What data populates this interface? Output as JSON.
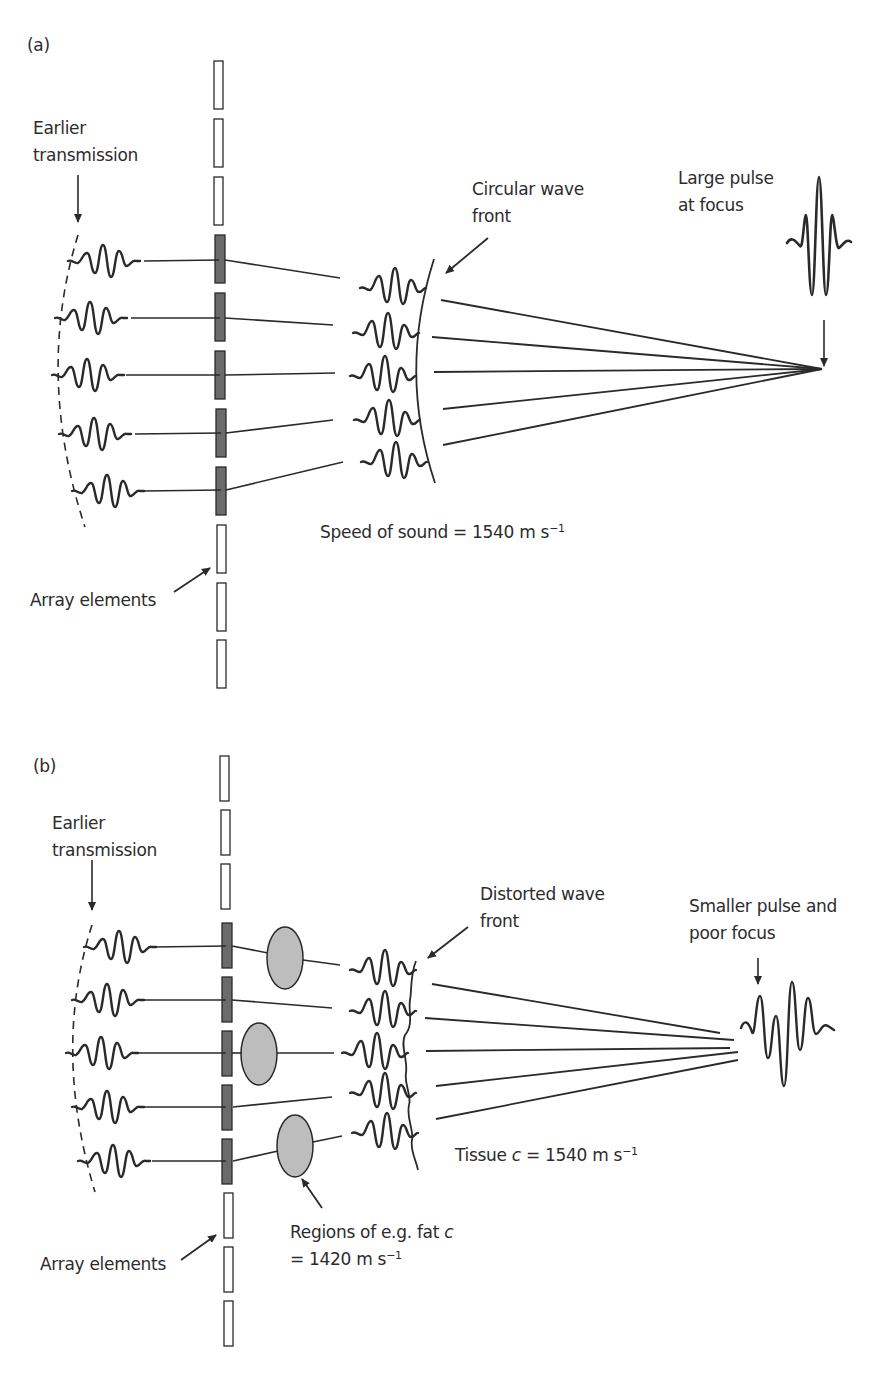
{
  "figure": {
    "panel_a": {
      "tag": "(a)",
      "earlier_transmission": [
        "Earlier",
        "transmission"
      ],
      "wavefront_label": [
        "Circular wave",
        "front"
      ],
      "focus_label": [
        "Large pulse",
        "at focus"
      ],
      "speed_label": "Speed of sound = 1540 m s",
      "speed_exp": "−1",
      "array_label": "Array elements"
    },
    "panel_b": {
      "tag": "(b)",
      "earlier_transmission": [
        "Earlier",
        "transmission"
      ],
      "wavefront_label": [
        "Distorted wave",
        "front"
      ],
      "focus_label": [
        "Smaller pulse and",
        "poor focus"
      ],
      "tissue_label_prefix": "Tissue ",
      "tissue_label_var": "c",
      "tissue_label_value": " = 1540 m s",
      "tissue_exp": "−1",
      "fat_label_line1_prefix": "Regions of e.g. fat ",
      "fat_label_var": "c",
      "fat_label_line2": "= 1420 m s",
      "fat_exp": "−1",
      "array_label": "Array elements"
    },
    "colors": {
      "line": "#2a2a2a",
      "active_element": "#6b6b6b",
      "inactive_element": "#ffffff",
      "fat_region": "#bdbdbd"
    },
    "icons": [
      "arrow-icon",
      "pulse-waveform-icon",
      "array-element-icon",
      "fat-region-ellipse-icon"
    ]
  }
}
